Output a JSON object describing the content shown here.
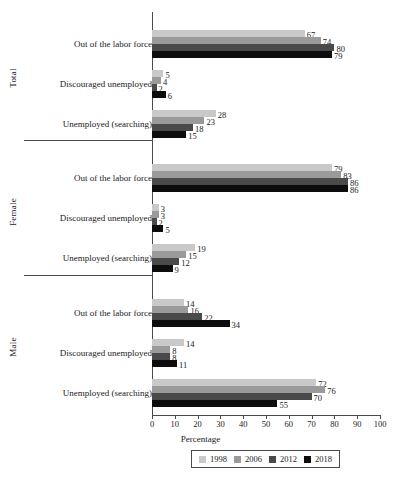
{
  "chart_data": {
    "type": "bar",
    "orientation": "horizontal",
    "title": "",
    "xlabel": "Percentage",
    "ylabel": "",
    "xlim": [
      0,
      100
    ],
    "xticks": [
      0,
      10,
      20,
      30,
      40,
      50,
      60,
      70,
      80,
      90,
      100
    ],
    "grid": false,
    "legend_position": "bottom",
    "series_names": [
      "1998",
      "2006",
      "2012",
      "2018"
    ],
    "series_colors": [
      "#c9c9c9",
      "#9a9a9a",
      "#4a4a4a",
      "#0d0d0d"
    ],
    "categories": [
      "Out of the labor force",
      "Discouraged unemployed",
      "Unemployed (searching)"
    ],
    "panels": [
      {
        "name": "Total",
        "groups": [
          {
            "category": "Out of the labor force",
            "values": [
              67,
              74,
              80,
              79
            ]
          },
          {
            "category": "Discouraged unemployed",
            "values": [
              5,
              4,
              2,
              6
            ]
          },
          {
            "category": "Unemployed (searching)",
            "values": [
              28,
              23,
              18,
              15
            ]
          }
        ]
      },
      {
        "name": "Female",
        "groups": [
          {
            "category": "Out of the labor force",
            "values": [
              79,
              83,
              86,
              86
            ]
          },
          {
            "category": "Discouraged unemployed",
            "values": [
              3,
              3,
              2,
              5
            ]
          },
          {
            "category": "Unemployed (searching)",
            "values": [
              19,
              15,
              12,
              9
            ]
          }
        ]
      },
      {
        "name": "Male",
        "groups": [
          {
            "category": "Out of the labor force",
            "values": [
              14,
              16,
              22,
              34
            ]
          },
          {
            "category": "Discouraged unemployed",
            "values": [
              14,
              8,
              8,
              11
            ]
          },
          {
            "category": "Unemployed (searching)",
            "values": [
              72,
              76,
              70,
              55
            ]
          }
        ]
      }
    ]
  },
  "legend": {
    "entries": [
      {
        "label": "1998",
        "color": "#c9c9c9"
      },
      {
        "label": "2006",
        "color": "#9a9a9a"
      },
      {
        "label": "2012",
        "color": "#4a4a4a"
      },
      {
        "label": "2018",
        "color": "#0d0d0d"
      }
    ]
  }
}
